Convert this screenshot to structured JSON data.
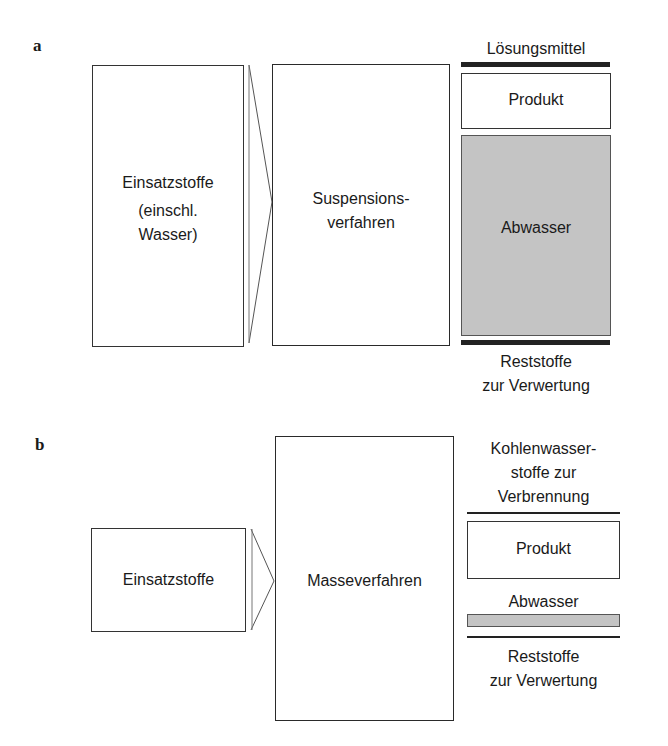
{
  "figure": {
    "panels": [
      {
        "label": "a",
        "input": {
          "lines": [
            "Einsatzstoffe",
            "(einschl.",
            "Wasser)"
          ]
        },
        "process": {
          "lines": [
            "Suspensions-",
            "verfahren"
          ]
        },
        "outputs": {
          "top_line_label": "Lösungsmittel",
          "product_label": "Produkt",
          "wastewater_label": "Abwasser",
          "residue_lines": [
            "Reststoffe",
            "zur Verwertung"
          ]
        }
      },
      {
        "label": "b",
        "input": {
          "lines": [
            "Einsatzstoffe"
          ]
        },
        "process": {
          "lines": [
            "Masseverfahren"
          ]
        },
        "outputs": {
          "top_lines": [
            "Kohlenwasser-",
            "stoffe zur",
            "Verbrennung"
          ],
          "product_label": "Produkt",
          "wastewater_label": "Abwasser",
          "residue_lines": [
            "Reststoffe",
            "zur Verwertung"
          ]
        }
      }
    ],
    "colors": {
      "line": "#222222",
      "wastewater_fill": "#c4c4c4",
      "background": "#ffffff"
    }
  }
}
